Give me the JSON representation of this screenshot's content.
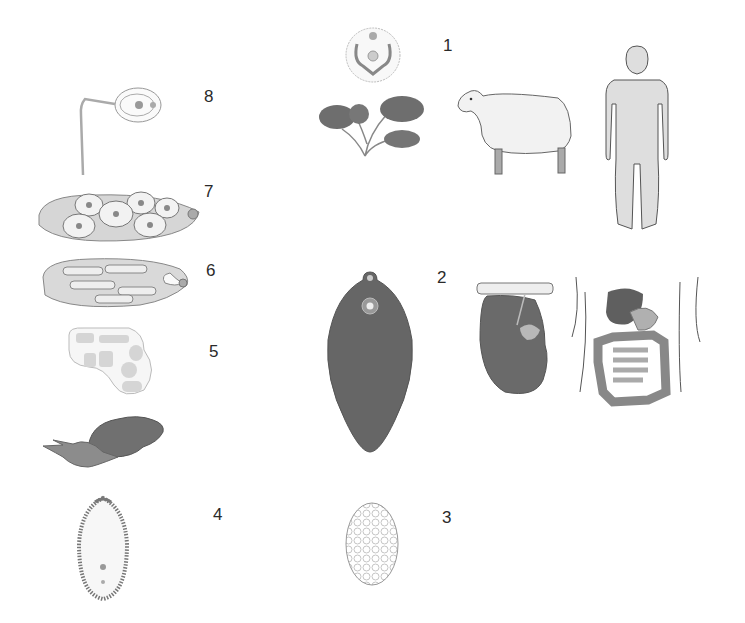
{
  "diagram": {
    "type": "life-cycle",
    "colors": {
      "dark_fill": "#6a6a6a",
      "mid_fill": "#8f8f8f",
      "light_fill": "#d9d9d9",
      "pale_fill": "#efefef",
      "outline": "#555555",
      "background": "#ffffff"
    },
    "stages": [
      {
        "number": "1",
        "label_num": "1",
        "items": [
          "metacercaria-cyst",
          "aquatic-plant",
          "sheep",
          "human"
        ]
      },
      {
        "number": "2",
        "label_num": "2",
        "items": [
          "adult-fluke",
          "liver",
          "human-digestive-system"
        ]
      },
      {
        "number": "3",
        "label_num": "3",
        "items": [
          "egg"
        ]
      },
      {
        "number": "4",
        "label_num": "4",
        "items": [
          "miracidium"
        ]
      },
      {
        "number": "5",
        "label_num": "5",
        "items": [
          "sporocyst",
          "snail"
        ]
      },
      {
        "number": "6",
        "label_num": "6",
        "items": [
          "redia"
        ]
      },
      {
        "number": "7",
        "label_num": "7",
        "items": [
          "redia-with-cercariae"
        ]
      },
      {
        "number": "8",
        "label_num": "8",
        "items": [
          "cercaria"
        ]
      }
    ]
  }
}
